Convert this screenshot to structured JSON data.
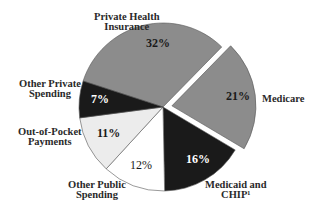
{
  "chart_data": {
    "type": "pie",
    "title": "",
    "exploded": [
      "Medicare"
    ],
    "slices": [
      {
        "label": "Private Health Insurance",
        "value": 32,
        "pct_label": "32%",
        "color": "#8c8c8c",
        "text_color": "#1a1a1a"
      },
      {
        "label": "Medicare",
        "value": 21,
        "pct_label": "21%",
        "color": "#8c8c8c",
        "text_color": "#1a1a1a"
      },
      {
        "label": "Medicaid and CHIP¹",
        "value": 16,
        "pct_label": "16%",
        "color": "#1a1a1a",
        "text_color": "#ffffff"
      },
      {
        "label": "Other Public Spending",
        "value": 12,
        "pct_label": "12%",
        "color": "#ffffff",
        "text_color": "#1a1a1a"
      },
      {
        "label": "Out-of-Pocket Payments",
        "value": 11,
        "pct_label": "11%",
        "color": "#ececec",
        "text_color": "#1a1a1a"
      },
      {
        "label": "Other Private Spending",
        "value": 7,
        "pct_label": "7%",
        "color": "#1a1a1a",
        "text_color": "#ffffff"
      }
    ],
    "legend": "none (direct labels)"
  },
  "labels": {
    "phi_line1": "Private Health",
    "phi_line2": "Insurance",
    "medicare": "Medicare",
    "medicaid_line1": "Medicaid and",
    "medicaid_line2": "CHIP¹",
    "other_public_line1": "Other Public",
    "other_public_line2": "Spending",
    "oop_line1": "Out-of-Pocket",
    "oop_line2": "Payments",
    "other_private_line1": "Other Private",
    "other_private_line2": "Spending"
  },
  "percents": {
    "phi": "32%",
    "medicare": "21%",
    "medicaid": "16%",
    "other_public": "12%",
    "oop": "11%",
    "other_private": "7%"
  }
}
